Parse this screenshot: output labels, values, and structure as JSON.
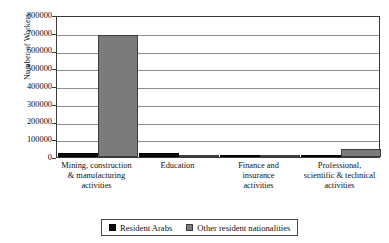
{
  "chart_data": {
    "type": "bar",
    "title": "",
    "xlabel": "",
    "ylabel": "Number of Workers",
    "ylim": [
      0,
      800000
    ],
    "ytick_labels": [
      "800000",
      "700000",
      "600000",
      "500000",
      "400000",
      "300000",
      "200000",
      "100000",
      "0"
    ],
    "ytick_values": [
      800000,
      700000,
      600000,
      500000,
      400000,
      300000,
      200000,
      100000,
      0
    ],
    "grid": true,
    "legend_position": "bottom",
    "categories": [
      "Mining, construction & manufacturing activities",
      "Education",
      "Finance and insurance activities",
      "Professional, scientific & technical activities"
    ],
    "category_lines": [
      [
        "Mining, construction",
        "& manufacturing",
        "activities"
      ],
      [
        "Education"
      ],
      [
        "Finance and",
        "insurance",
        "activities"
      ],
      [
        "Professional,",
        "scientific & technical",
        "activities"
      ]
    ],
    "series": [
      {
        "name": "Resident Arabs",
        "color": "#0d0d0d",
        "values": [
          20000,
          22000,
          12000,
          8000
        ]
      },
      {
        "name": "Other resident nationalities",
        "color": "#7b7b7b",
        "values": [
          685000,
          10000,
          10000,
          45000
        ]
      }
    ]
  },
  "legend": {
    "items": [
      {
        "label": "Resident Arabs",
        "swatch": "black-square-swatch"
      },
      {
        "label": "Other resident nationalities",
        "swatch": "gray-square-swatch"
      }
    ]
  }
}
